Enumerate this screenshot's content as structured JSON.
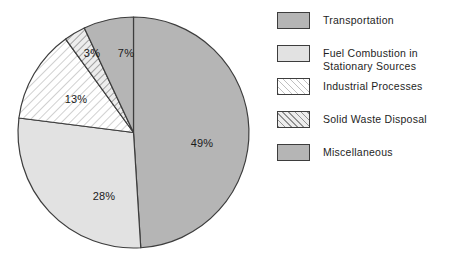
{
  "chart_data": {
    "type": "pie",
    "title": "",
    "categories": [
      "Transportation",
      "Fuel Combustion in\nStationary Sources",
      "Industrial Processes",
      "Solid Waste Disposal",
      "Miscellaneous"
    ],
    "values": [
      49,
      28,
      13,
      3,
      7
    ],
    "value_labels": [
      "49%",
      "28%",
      "13%",
      "3%",
      "7%"
    ],
    "units": "percent",
    "start_angle_deg": 0,
    "direction": "clockwise",
    "legend_position": "right",
    "grid": false,
    "slices": [
      {
        "label": "Transportation",
        "value": 49,
        "value_label": "49%",
        "fill": "solid-mid",
        "color": "#b5b5b5",
        "start_deg": 0,
        "end_deg": 176.4,
        "label_x": 190,
        "label_y": 133
      },
      {
        "label": "Fuel Combustion in\nStationary Sources",
        "value": 28,
        "value_label": "28%",
        "fill": "solid-light",
        "color": "#e2e2e2",
        "start_deg": 176.4,
        "end_deg": 277.2,
        "label_x": 92,
        "label_y": 186
      },
      {
        "label": "Industrial Processes",
        "value": 13,
        "value_label": "13%",
        "fill": "hatch-faint",
        "color": "#ffffff",
        "start_deg": 277.2,
        "end_deg": 324.0,
        "label_x": 64,
        "label_y": 89
      },
      {
        "label": "Solid Waste Disposal",
        "value": 3,
        "value_label": "3%",
        "fill": "hatch-strong",
        "color": "#ededed",
        "start_deg": 324.0,
        "end_deg": 334.8,
        "label_x": 80,
        "label_y": 43
      },
      {
        "label": "Miscellaneous",
        "value": 7,
        "value_label": "7%",
        "fill": "solid-mid",
        "color": "#b5b5b5",
        "start_deg": 334.8,
        "end_deg": 360.0,
        "label_x": 114,
        "label_y": 43
      }
    ]
  },
  "legend": {
    "items": [
      {
        "label": "Transportation",
        "fill": "solid-mid",
        "color": "#b5b5b5"
      },
      {
        "label": "Fuel Combustion in\nStationary Sources",
        "fill": "solid-light",
        "color": "#e2e2e2"
      },
      {
        "label": "Industrial Processes",
        "fill": "hatch-faint",
        "color": "#ffffff"
      },
      {
        "label": "Solid Waste Disposal",
        "fill": "hatch-strong",
        "color": "#ededed"
      },
      {
        "label": "Miscellaneous",
        "fill": "solid-mid",
        "color": "#b5b5b5"
      }
    ]
  },
  "style": {
    "outline_color": "#3d3d3d",
    "text_color": "#1e1e1e",
    "background": "#ffffff"
  }
}
